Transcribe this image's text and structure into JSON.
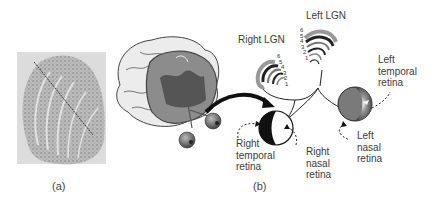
{
  "panels": {
    "a": {
      "caption": "(a)",
      "image": "lgn-tissue-section-micrograph"
    },
    "b": {
      "caption": "(b)",
      "image": "visual-pathway-schematic"
    }
  },
  "labels": {
    "right_lgn": "Right LGN",
    "left_lgn": "Left LGN",
    "left_temporal_retina": "Left\ntemporal\nretina",
    "left_nasal_retina": "Left\nnasal\nretina",
    "right_temporal_retina": "Right\ntemporal\nretina",
    "right_nasal_retina": "Right\nnasal\nretina"
  },
  "lgn_layers": {
    "right": [
      "6",
      "5",
      "4",
      "3",
      "2",
      "1"
    ],
    "left": [
      "6",
      "5",
      "4",
      "3",
      "2",
      "1"
    ]
  },
  "colors": {
    "brain_outer": "#e6e6e6",
    "brain_section": "#8a8a8a",
    "brain_dark": "#555555",
    "eye_left": "#6e6e6e",
    "arrow": "#111111"
  }
}
